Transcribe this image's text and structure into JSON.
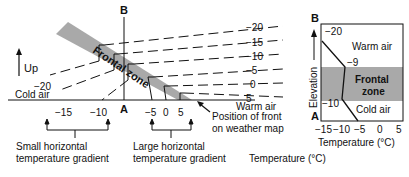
{
  "left_diagram": {
    "up_label": "Up",
    "point_b": "B",
    "point_a": "A",
    "frontal_zone_label": "Frontal zone",
    "cold_air_label": "Cold air",
    "warm_air_label": "Warm air",
    "isotherm_labels_right": [
      "−20",
      "−15",
      "−10",
      "−5",
      "0",
      "5"
    ],
    "isotherm_label_left": "−20",
    "axis_ticks": [
      "−15",
      "−10",
      "A",
      "−5",
      "0",
      "5"
    ],
    "front_position_label_line1": "Position of front",
    "front_position_label_line2": "on weather map",
    "small_gradient_line1": "Small horizontal",
    "small_gradient_line2": "temperature gradient",
    "large_gradient_line1": "Large horizontal",
    "large_gradient_line2": "temperature gradient",
    "temperature_label": "Temperature (°C)"
  },
  "right_chart": {
    "point_b": "B",
    "point_a": "A",
    "y_axis_label": "Elevation",
    "warm_air_label": "Warm air",
    "frontal_zone_line1": "Frontal",
    "frontal_zone_line2": "zone",
    "cold_air_label": "Cold air",
    "profile_labels": [
      "−20",
      "−9",
      "−10"
    ],
    "x_ticks": [
      "−15",
      "−10",
      "−5",
      "0",
      "5"
    ],
    "x_axis_label": "Temperature (°C)"
  },
  "colors": {
    "frontal_zone": "#a9a9a9",
    "line": "#111111"
  }
}
